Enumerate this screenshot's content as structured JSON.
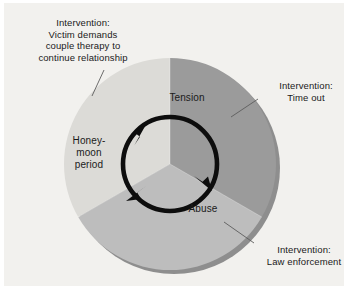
{
  "figure": {
    "background_color": "#f2f1ee",
    "page_color": "#ffffff"
  },
  "wheel": {
    "center": {
      "x": 170,
      "y": 164
    },
    "outer_radius": 106,
    "inner_ring_radius": 47,
    "rotation_direction": "clockwise",
    "shadow_color": "#8e8e8e",
    "ring_color": "#0d0d0d",
    "segments": [
      {
        "id": "tension",
        "label": "Tension",
        "color": "#9b9b9b",
        "start_angle_deg": -90,
        "end_angle_deg": 30
      },
      {
        "id": "abuse",
        "label": "Abuse",
        "color": "#bdbdbd",
        "start_angle_deg": 30,
        "end_angle_deg": 150
      },
      {
        "id": "honeymoon",
        "label": "Honey-\nmoon\nperiod",
        "color": "#dcdbd7",
        "start_angle_deg": 150,
        "end_angle_deg": 270
      }
    ]
  },
  "callouts": [
    {
      "id": "therapy",
      "text": "Intervention:\nVictim demands\ncouple therapy to\ncontinue relationship",
      "targets_segment": "honeymoon",
      "leader_from": {
        "x": 104,
        "y": 70
      },
      "leader_to": {
        "x": 92,
        "y": 96
      }
    },
    {
      "id": "timeout",
      "text": "Intervention:\nTime out",
      "targets_segment": "tension",
      "leader_from": {
        "x": 258,
        "y": 99
      },
      "leader_to": {
        "x": 231,
        "y": 117
      }
    },
    {
      "id": "law",
      "text": "Intervention:\nLaw enforcement",
      "targets_segment": "abuse",
      "leader_from": {
        "x": 254,
        "y": 243
      },
      "leader_to": {
        "x": 224,
        "y": 222
      }
    }
  ]
}
